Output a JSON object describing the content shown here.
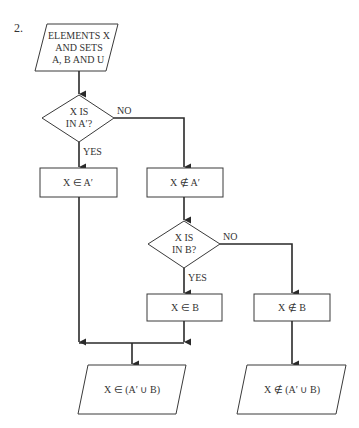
{
  "figure_number": "2.",
  "nodes": {
    "input": {
      "lines": [
        "ELEMENTS X",
        "AND SETS",
        "A, B AND U"
      ]
    },
    "decision_a": {
      "lines": [
        "X IS",
        "IN A′?"
      ]
    },
    "in_a_prime": {
      "text": "X ∈ A′"
    },
    "not_in_a_prime": {
      "text": "X ∉ A′"
    },
    "decision_b": {
      "lines": [
        "X IS",
        "IN B?"
      ]
    },
    "in_b": {
      "text": "X ∈ B"
    },
    "not_in_b": {
      "text": "X ∉ B"
    },
    "output_in_union": {
      "text": "X ∈ (A′ ∪ B)"
    },
    "output_not_in_union": {
      "text": "X ∉ (A′ ∪ B)"
    }
  },
  "edge_labels": {
    "decision_a_no": "NO",
    "decision_a_yes": "YES",
    "decision_b_no": "NO",
    "decision_b_yes": "YES"
  }
}
